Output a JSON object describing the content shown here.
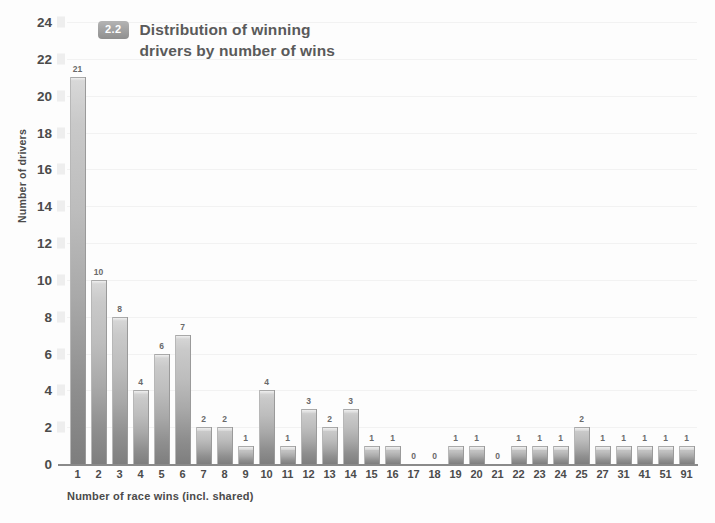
{
  "chart_data": {
    "type": "bar",
    "title": "Distribution of winning drivers by number of wins",
    "title_line1": "Distribution of winning",
    "title_line2": "drivers by number of wins",
    "badge": "2.2",
    "xlabel": "Number of race wins (incl. shared)",
    "ylabel": "Number of drivers",
    "ylim": [
      0,
      24
    ],
    "ytick_step": 2,
    "yticks": [
      0,
      2,
      4,
      6,
      8,
      10,
      12,
      14,
      16,
      18,
      20,
      22,
      24
    ],
    "grid": true,
    "legend": "none",
    "categories": [
      "1",
      "2",
      "3",
      "4",
      "5",
      "6",
      "7",
      "8",
      "9",
      "10",
      "11",
      "12",
      "13",
      "14",
      "15",
      "16",
      "17",
      "18",
      "19",
      "20",
      "21",
      "22",
      "23",
      "24",
      "25",
      "27",
      "31",
      "41",
      "51",
      "91"
    ],
    "values": [
      21,
      10,
      8,
      4,
      6,
      7,
      2,
      2,
      1,
      4,
      1,
      3,
      2,
      3,
      1,
      1,
      0,
      0,
      1,
      1,
      0,
      1,
      1,
      1,
      2,
      1,
      1,
      1,
      1,
      1
    ],
    "data_labels": [
      "21",
      "10",
      "8",
      "4",
      "6",
      "7",
      "2",
      "2",
      "1",
      "4",
      "1",
      "3",
      "2",
      "3",
      "1",
      "1",
      "0",
      "0",
      "1",
      "1",
      "0",
      "1",
      "1",
      "1",
      "2",
      "1",
      "1",
      "1",
      "1",
      "1"
    ]
  },
  "colors": {
    "bar_top": "#d9d9d9",
    "bar_bottom": "#7e7e7e",
    "axis": "#8a8a8a",
    "text": "#4b4b4b",
    "title_text": "#5a5a5a",
    "badge_bg": "#9a9a9a",
    "gridline": "#f2f2f2",
    "background": "#fdfdfd"
  }
}
